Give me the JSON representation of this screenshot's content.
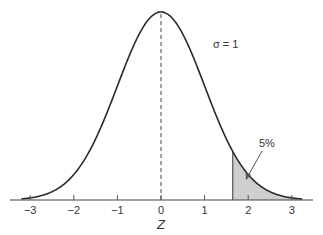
{
  "chart_data": {
    "type": "area",
    "title": "",
    "distribution": "standard normal",
    "xlabel": "Z",
    "ylabel": "",
    "xlim": [
      -3.4,
      3.5
    ],
    "x_ticks": [
      -3,
      -2,
      -1,
      0,
      1,
      2,
      3
    ],
    "x_tick_labels": [
      "−3",
      "−2",
      "−1",
      "0",
      "1",
      "2",
      "3"
    ],
    "mean": 0,
    "sigma": 1,
    "mean_line": {
      "x": 0,
      "style": "dashed"
    },
    "shaded_region": {
      "from": 1.645,
      "to": 3.2,
      "label": "5%",
      "color": "#cfcfcf"
    },
    "annotations": [
      {
        "text": "σ = 1",
        "x": 1.45,
        "y": 0.34
      },
      {
        "text": "5%",
        "x": 2.2,
        "y": 0.12,
        "arrow_to": [
          1.95,
          0.05
        ]
      }
    ],
    "grid": false,
    "legend": null
  },
  "colors": {
    "curve": "#2a2a2a",
    "axis": "#444444",
    "shade": "#cfcfcf",
    "text": "#333333"
  }
}
